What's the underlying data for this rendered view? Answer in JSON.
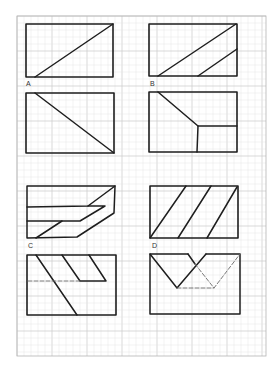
{
  "figure": {
    "background": "#ffffff",
    "ink_color": "#1e1e1e",
    "dash_color": "#6a6a6a",
    "grid": {
      "x0": 17,
      "y0": 16,
      "x1": 266,
      "y1": 356,
      "minor_step": 7,
      "major_every": 5,
      "minor_color": "#e6e6e6",
      "major_color": "#cfcfcf",
      "border_color": "#b5b5b5"
    },
    "labels": [
      {
        "text": "A",
        "x": 26,
        "y": 80
      },
      {
        "text": "B",
        "x": 150,
        "y": 80
      },
      {
        "text": "C",
        "x": 28,
        "y": 242
      },
      {
        "text": "D",
        "x": 152,
        "y": 242
      }
    ],
    "panels": [
      {
        "name": "panel-a-top",
        "rect": {
          "x": 26,
          "y": 24,
          "w": 87,
          "h": 53
        },
        "lines": [
          {
            "points": [
              [
                35,
                77
              ],
              [
                113,
                24
              ]
            ],
            "dashed": false
          }
        ]
      },
      {
        "name": "panel-a-bottom",
        "rect": {
          "x": 26,
          "y": 93,
          "w": 88,
          "h": 60
        },
        "lines": [
          {
            "points": [
              [
                35,
                93
              ],
              [
                114,
                153
              ]
            ],
            "dashed": false
          }
        ]
      },
      {
        "name": "panel-b-top",
        "rect": {
          "x": 149,
          "y": 24,
          "w": 88,
          "h": 52
        },
        "lines": [
          {
            "points": [
              [
                158,
                76
              ],
              [
                236,
                24
              ]
            ],
            "dashed": false
          },
          {
            "points": [
              [
                198,
                76
              ],
              [
                237,
                49
              ]
            ],
            "dashed": false
          }
        ]
      },
      {
        "name": "panel-b-bottom",
        "rect": {
          "x": 149,
          "y": 92,
          "w": 88,
          "h": 60
        },
        "lines": [
          {
            "points": [
              [
                158,
                92
              ],
              [
                198,
                126
              ],
              [
                237,
                126
              ]
            ],
            "dashed": false
          },
          {
            "points": [
              [
                198,
                126
              ],
              [
                197,
                152
              ]
            ],
            "dashed": false
          }
        ]
      },
      {
        "name": "panel-c-top",
        "rect": null,
        "lines": [
          {
            "points": [
              [
                27,
                186
              ],
              [
                115,
                186
              ],
              [
                114,
                213
              ],
              [
                77,
                237
              ],
              [
                27,
                238
              ],
              [
                27,
                186
              ]
            ],
            "dashed": false
          },
          {
            "points": [
              [
                27,
                207
              ],
              [
                88,
                206
              ],
              [
                115,
                186
              ]
            ],
            "dashed": false
          },
          {
            "points": [
              [
                88,
                206
              ],
              [
                105,
                206
              ],
              [
                80,
                221
              ],
              [
                27,
                221
              ]
            ],
            "dashed": false
          },
          {
            "points": [
              [
                36,
                238
              ],
              [
                62,
                221
              ]
            ],
            "dashed": false
          }
        ]
      },
      {
        "name": "panel-c-bottom",
        "rect": {
          "x": 27,
          "y": 255,
          "w": 89,
          "h": 60
        },
        "lines": [
          {
            "points": [
              [
                36,
                255
              ],
              [
                77,
                315
              ]
            ],
            "dashed": false
          },
          {
            "points": [
              [
                62,
                255
              ],
              [
                80,
                281
              ],
              [
                106,
                281
              ],
              [
                89,
                255
              ]
            ],
            "dashed": false
          },
          {
            "points": [
              [
                28,
                281
              ],
              [
                80,
                281
              ]
            ],
            "dashed": true
          }
        ]
      },
      {
        "name": "panel-d-top",
        "rect": {
          "x": 150,
          "y": 186,
          "w": 88,
          "h": 52
        },
        "lines": [
          {
            "points": [
              [
                150,
                238
              ],
              [
                186,
                186
              ]
            ],
            "dashed": false
          },
          {
            "points": [
              [
                178,
                238
              ],
              [
                211,
                186
              ]
            ],
            "dashed": false
          },
          {
            "points": [
              [
                207,
                238
              ],
              [
                237,
                187
              ]
            ],
            "dashed": false
          }
        ]
      },
      {
        "name": "panel-d-bottom",
        "rect": null,
        "lines": [
          {
            "points": [
              [
                188,
                254
              ],
              [
                150,
                254
              ],
              [
                150,
                314
              ],
              [
                240,
                314
              ],
              [
                240,
                254
              ],
              [
                206,
                254
              ]
            ],
            "dashed": false
          },
          {
            "points": [
              [
                150,
                254
              ],
              [
                177,
                288
              ],
              [
                206,
                254
              ]
            ],
            "dashed": false
          },
          {
            "points": [
              [
                188,
                254
              ],
              [
                195,
                264
              ]
            ],
            "dashed": false
          },
          {
            "points": [
              [
                195,
                264
              ],
              [
                214,
                288
              ],
              [
                240,
                254
              ]
            ],
            "dashed": true
          },
          {
            "points": [
              [
                177,
                288
              ],
              [
                214,
                288
              ]
            ],
            "dashed": true
          }
        ]
      }
    ]
  }
}
